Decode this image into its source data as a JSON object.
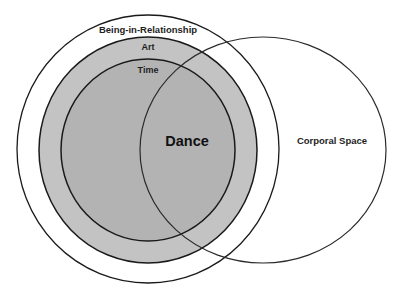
{
  "diagram": {
    "type": "nested-venn",
    "background": "#ffffff",
    "stroke_color": "#1a1a1a",
    "sets": {
      "being_in_relationship": {
        "label": "Being-in-Relationship",
        "fill": "#ffffff",
        "contains": [
          "art"
        ]
      },
      "art": {
        "label": "Art",
        "fill": "#c3c3c3",
        "contains": [
          "time"
        ]
      },
      "time": {
        "label": "Time",
        "fill": "#b3b3b3"
      },
      "corporal_space": {
        "label": "Corporal Space",
        "fill": "none",
        "overlaps": [
          "being_in_relationship",
          "art",
          "time"
        ]
      }
    },
    "intersection": {
      "label": "Dance",
      "of": [
        "time",
        "corporal_space"
      ]
    }
  }
}
